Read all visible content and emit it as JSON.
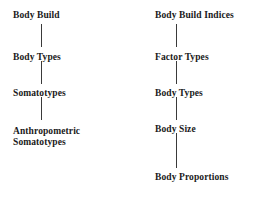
{
  "diagram": {
    "title": "",
    "type": "two-column-flow-chart",
    "text_color": "#1a1a1a",
    "line_color": "#3a3a3a",
    "background": "#ffffff",
    "columns": [
      {
        "id": "body-build",
        "heading": "Body Build",
        "nodes": [
          {
            "label": "Body Build",
            "x": 13,
            "y": 10
          },
          {
            "label": "Body Types",
            "x": 13,
            "y": 52
          },
          {
            "label": "Somatotypes",
            "x": 13,
            "y": 88
          },
          {
            "label": "Anthropometric\nSomatotypes",
            "x": 13,
            "y": 126
          }
        ],
        "connectors": [
          {
            "x": 41,
            "y": 24,
            "height": 23
          },
          {
            "x": 41,
            "y": 61,
            "height": 23
          },
          {
            "x": 41,
            "y": 97,
            "height": 23
          }
        ]
      },
      {
        "id": "body-build-indices",
        "heading": "Body Build Indices",
        "nodes": [
          {
            "label": "Body Build Indices",
            "x": 21,
            "y": 10
          },
          {
            "label": "Factor Types",
            "x": 21,
            "y": 52
          },
          {
            "label": "Body Types",
            "x": 21,
            "y": 88
          },
          {
            "label": "Body Size",
            "x": 21,
            "y": 124
          },
          {
            "label": "Body Proportions",
            "x": 21,
            "y": 172
          }
        ],
        "connectors": [
          {
            "x": 42,
            "y": 24,
            "height": 23
          },
          {
            "x": 42,
            "y": 61,
            "height": 23
          },
          {
            "x": 42,
            "y": 97,
            "height": 23
          },
          {
            "x": 42,
            "y": 133,
            "height": 35
          }
        ]
      }
    ]
  }
}
